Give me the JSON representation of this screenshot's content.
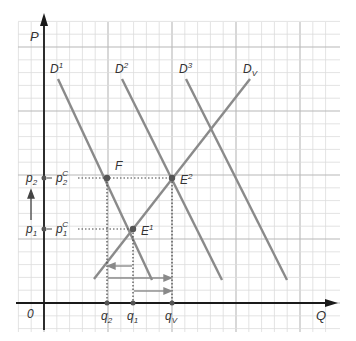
{
  "diagram": {
    "axes": {
      "y_label": "P",
      "x_label": "Q",
      "origin_label": "0"
    },
    "curves": [
      {
        "id": "D1",
        "label_base": "D",
        "label_sup": "1"
      },
      {
        "id": "D2",
        "label_base": "D",
        "label_sup": "2"
      },
      {
        "id": "D3",
        "label_base": "D",
        "label_sup": "3"
      },
      {
        "id": "Dv",
        "label_base": "D",
        "label_sub": "V"
      }
    ],
    "points": {
      "F": "F",
      "E1_base": "E",
      "E1_sup": "1",
      "E2_base": "E",
      "E2_sup": "2"
    },
    "price_labels": {
      "p2_base": "p",
      "p2_sub": "2",
      "p1_base": "p",
      "p1_sub": "1",
      "p2c_base": "p",
      "p2c_sub": "2",
      "p2c_sup": "C",
      "p1c_base": "p",
      "p1c_sub": "1",
      "p1c_sup": "C"
    },
    "quantity_labels": {
      "q2_base": "q",
      "q2_sub": "2",
      "q1_base": "q",
      "q1_sub": "1",
      "qv_base": "q",
      "qv_sub": "V"
    },
    "colors": {
      "curve": "#8a8a8a",
      "axis": "#1a1a1a",
      "grid_minor": "#dcdcdc",
      "grid_major": "#b8b8b8",
      "dot": "#555555"
    }
  }
}
